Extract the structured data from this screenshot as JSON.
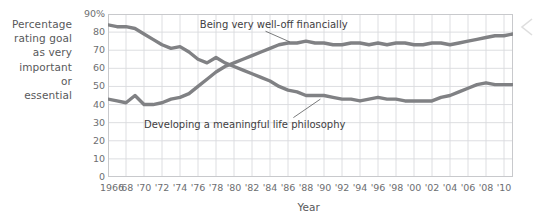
{
  "figure": {
    "y_axis_caption_lines": [
      "Percentage",
      "rating goal",
      "as very",
      "important",
      "or",
      "essential"
    ],
    "x_axis_title": "Year",
    "y_ticks": [
      "90%",
      "80",
      "70",
      "60",
      "50",
      "40",
      "30",
      "20",
      "10",
      "0"
    ],
    "x_ticks": [
      "1966",
      "'68",
      "'70",
      "'72",
      "'74",
      "'76",
      "'78",
      "'80",
      "'82",
      "'84",
      "'86",
      "'88",
      "'90",
      "'92",
      "'94",
      "'96",
      "'98",
      "'00",
      "'02",
      "'04",
      "'06",
      "'08",
      "'10"
    ],
    "label_welloff": "Being very well-off financially",
    "label_philosophy": "Developing a meaningful life philosophy",
    "nav_chevron": "chevron-left-icon"
  },
  "chart_data": {
    "type": "line",
    "title": "",
    "xlabel": "Year",
    "ylabel": "Percentage rating goal as very important or essential",
    "xlim": [
      1966,
      2011
    ],
    "ylim": [
      0,
      90
    ],
    "ytick_values": [
      0,
      10,
      20,
      30,
      40,
      50,
      60,
      70,
      80,
      90
    ],
    "xtick_values": [
      1966,
      1968,
      1970,
      1972,
      1974,
      1976,
      1978,
      1980,
      1982,
      1984,
      1986,
      1988,
      1990,
      1992,
      1994,
      1996,
      1998,
      2000,
      2002,
      2004,
      2006,
      2008,
      2010
    ],
    "grid": true,
    "legend": "inline-annotations",
    "line_color": "#808184",
    "series": [
      {
        "name": "Developing a meaningful life philosophy",
        "x": [
          1966,
          1967,
          1968,
          1969,
          1970,
          1971,
          1972,
          1973,
          1974,
          1975,
          1976,
          1977,
          1978,
          1979,
          1980,
          1981,
          1982,
          1983,
          1984,
          1985,
          1986,
          1987,
          1988,
          1989,
          1990,
          1991,
          1992,
          1993,
          1994,
          1995,
          1996,
          1997,
          1998,
          1999,
          2000,
          2001,
          2002,
          2003,
          2004,
          2005,
          2006,
          2007,
          2008,
          2009,
          2010,
          2011
        ],
        "values": [
          84,
          83,
          83,
          82,
          79,
          76,
          73,
          71,
          72,
          69,
          65,
          63,
          66,
          63,
          61,
          59,
          57,
          55,
          53,
          50,
          48,
          47,
          45,
          45,
          45,
          44,
          43,
          43,
          42,
          43,
          44,
          43,
          43,
          42,
          42,
          42,
          42,
          44,
          45,
          47,
          49,
          51,
          52,
          51,
          51,
          51
        ]
      },
      {
        "name": "Being very well-off financially",
        "x": [
          1966,
          1967,
          1968,
          1969,
          1970,
          1971,
          1972,
          1973,
          1974,
          1975,
          1976,
          1977,
          1978,
          1979,
          1980,
          1981,
          1982,
          1983,
          1984,
          1985,
          1986,
          1987,
          1988,
          1989,
          1990,
          1991,
          1992,
          1993,
          1994,
          1995,
          1996,
          1997,
          1998,
          1999,
          2000,
          2001,
          2002,
          2003,
          2004,
          2005,
          2006,
          2007,
          2008,
          2009,
          2010,
          2011
        ],
        "values": [
          43,
          42,
          41,
          45,
          40,
          40,
          41,
          43,
          44,
          46,
          50,
          54,
          58,
          61,
          63,
          65,
          67,
          69,
          71,
          73,
          74,
          74,
          75,
          74,
          74,
          73,
          73,
          74,
          74,
          73,
          74,
          73,
          74,
          74,
          73,
          73,
          74,
          74,
          73,
          74,
          75,
          76,
          77,
          78,
          78,
          79
        ]
      }
    ],
    "annotations": [
      {
        "text": "Being very well-off financially",
        "points_to_series": "Being very well-off financially"
      },
      {
        "text": "Developing a meaningful life philosophy",
        "points_to_series": "Developing a meaningful life philosophy"
      }
    ]
  }
}
